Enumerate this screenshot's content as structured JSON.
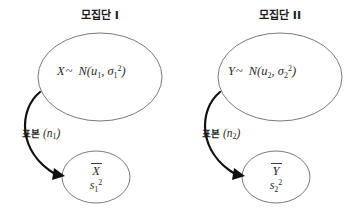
{
  "diagram": {
    "background_color": "#ffffff",
    "stroke_color": "#6b6b6b",
    "arrow_color": "#111111"
  },
  "groups": [
    {
      "title": "모집단 I",
      "population_variable": "X",
      "relation_symbol": "~",
      "distribution_name": "N",
      "distribution_mean": "u",
      "distribution_mean_sub": "1",
      "distribution_var": "σ",
      "distribution_var_sub": "1",
      "distribution_var_sup": "2",
      "sample_label": "표본",
      "sample_size": "(n",
      "sample_size_sub": "1",
      "sample_size_close": ")",
      "sample_mean": "X",
      "sample_var": "s",
      "sample_var_sub": "1",
      "sample_var_sup": "2"
    },
    {
      "title": "모집단 II",
      "population_variable": "Y",
      "relation_symbol": "~",
      "distribution_name": "N",
      "distribution_mean": "u",
      "distribution_mean_sub": "2",
      "distribution_var": "σ",
      "distribution_var_sub": "2",
      "distribution_var_sup": "2",
      "sample_label": "표본",
      "sample_size": "(n",
      "sample_size_sub": "2",
      "sample_size_close": ")",
      "sample_mean": "Y",
      "sample_var": "s",
      "sample_var_sub": "2",
      "sample_var_sup": "2"
    }
  ]
}
